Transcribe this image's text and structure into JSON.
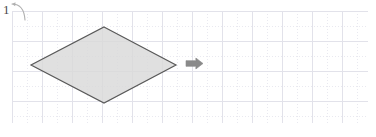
{
  "canvas": {
    "name": "drawing-canvas",
    "width": 376,
    "height": 137,
    "background_color": "#ffffff"
  },
  "grid": {
    "name": "page-grid",
    "origin_x": 12,
    "origin_y": 11,
    "right": 368,
    "bottom": 123,
    "major_spacing": 30,
    "minor_spacing": 15,
    "major_color": "#e2e2ea",
    "minor_color": "#e9e9f0",
    "minor_style": "dotted"
  },
  "shapes": [
    {
      "name": "diamond-shape",
      "type": "rhombus",
      "label": "",
      "fill_color": "#d9d9d9",
      "stroke_color": "#595959",
      "stroke_width": 1.2,
      "points": "104,27 176,65 104,103 31,65",
      "vertices": {
        "top": [
          104,
          27
        ],
        "right": [
          176,
          65
        ],
        "bottom": [
          104,
          103
        ],
        "left": [
          31,
          65
        ]
      },
      "bbox": {
        "x": 31,
        "y": 27,
        "width": 145,
        "height": 76
      }
    }
  ],
  "markers": [
    {
      "name": "right-arrow-marker",
      "type": "arrow",
      "direction": "right",
      "color": "#8a8a8a",
      "x": 186,
      "y": 58,
      "width": 17,
      "height": 11
    }
  ],
  "annotations": [
    {
      "name": "step-number-label",
      "text": "1",
      "color": "#4a4a4a",
      "x": 2,
      "y": 1,
      "font_size": 13
    },
    {
      "name": "rotate-arrow-icon",
      "type": "curved-arrow",
      "color": "#b0b0b0",
      "x": 11,
      "y": 2,
      "width": 16,
      "height": 19
    }
  ]
}
